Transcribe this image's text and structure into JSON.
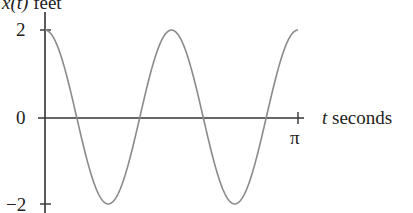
{
  "chart_data": {
    "type": "line",
    "title": "",
    "ylabel": "x(t) feet",
    "xlabel": "t seconds",
    "xlim": [
      0,
      3.14159
    ],
    "ylim": [
      -2,
      2
    ],
    "x_ticks": [
      {
        "value": 3.14159,
        "label": "π"
      }
    ],
    "y_ticks": [
      {
        "value": 2,
        "label": "2"
      },
      {
        "value": 0,
        "label": "0"
      },
      {
        "value": -2,
        "label": "−2"
      }
    ],
    "grid": false,
    "legend": null,
    "series": [
      {
        "name": "x(t) = 2cos(4t)",
        "function": "2*cos(4*t)",
        "color": "#8a8a8a",
        "x": [
          0,
          0.3927,
          0.7854,
          1.1781,
          1.5708,
          1.9635,
          2.3562,
          2.7489,
          3.14159
        ],
        "values": [
          2,
          0,
          -2,
          0,
          2,
          0,
          -2,
          0,
          2
        ]
      }
    ]
  },
  "labels": {
    "y_axis_var": "x",
    "y_axis_arg": "(t)",
    "y_axis_unit": "feet",
    "x_axis_var": "t",
    "x_axis_unit": "seconds",
    "tick_pi": "π",
    "tick_2": "2",
    "tick_0": "0",
    "tick_neg2": "−2"
  },
  "colors": {
    "axis": "#333333",
    "curve": "#8a8a8a"
  }
}
